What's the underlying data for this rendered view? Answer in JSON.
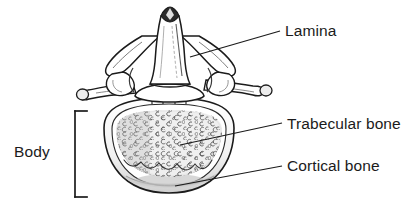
{
  "figure": {
    "kind": "anatomical-line-drawing",
    "background_color": "#ffffff",
    "ink_color": "#1b1b1b",
    "bone_fill": "#ffffff",
    "shade_gray": "#d9d9d9",
    "trabecular_fill": "#ededed"
  },
  "labels": {
    "lamina": "Lamina",
    "trabecular_bone": "Trabecular bone",
    "cortical_bone": "Cortical bone",
    "body": "Body"
  },
  "leader_lines": [
    {
      "name": "lamina-leader",
      "from": [
        190,
        57
      ],
      "to": [
        280,
        31
      ]
    },
    {
      "name": "trabecular-leader",
      "from": [
        180,
        145
      ],
      "to": [
        282,
        123
      ]
    },
    {
      "name": "cortical-leader",
      "from": [
        175,
        186
      ],
      "to": [
        282,
        166
      ]
    }
  ],
  "bracket": {
    "name": "body-bracket",
    "x": 75,
    "top": 111,
    "bottom": 197,
    "tick_length": 12
  },
  "structures": [
    "spinous process",
    "lamina",
    "superior articular process",
    "transverse process",
    "pedicle",
    "vertebral body",
    "cortical bone rim",
    "trabecular bone"
  ]
}
